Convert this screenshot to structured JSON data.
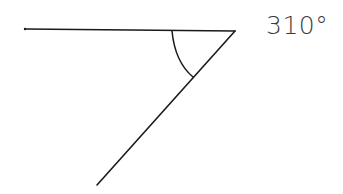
{
  "diagram": {
    "type": "angle",
    "label": "310°",
    "angle_degrees": 310,
    "colors": {
      "stroke": "#1a1a1a",
      "label": "#3a3a3a",
      "background": "#ffffff"
    },
    "vertex": {
      "x": 235,
      "y": 31
    },
    "rays": [
      {
        "name": "horizontal-ray",
        "from": {
          "x": 235,
          "y": 31
        },
        "to": {
          "x": 25,
          "y": 29
        }
      },
      {
        "name": "diagonal-ray",
        "from": {
          "x": 235,
          "y": 31
        },
        "to": {
          "x": 97,
          "y": 185
        }
      }
    ],
    "arc": {
      "start": {
        "x": 172,
        "y": 31
      },
      "end": {
        "x": 193,
        "y": 77
      }
    }
  }
}
